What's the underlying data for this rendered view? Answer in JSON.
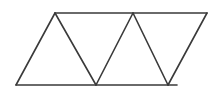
{
  "figure": {
    "background_color": "#ffffff",
    "stroke_color": "#3a3a3a",
    "stroke_width": 1.6,
    "canvas": {
      "width": 219,
      "height": 93
    }
  },
  "chart_data": {
    "type": "diagram",
    "xlabel": "",
    "ylabel": "",
    "grid": false,
    "legend": null,
    "xlim": [
      0,
      219
    ],
    "ylim": [
      0,
      93
    ],
    "vertices": {
      "top_left": [
        55,
        13
      ],
      "top_mid": [
        133,
        13
      ],
      "top_right": [
        207,
        13
      ],
      "bottom_left": [
        16,
        85
      ],
      "bottom_mid": [
        96,
        85
      ],
      "bottom_right": [
        168,
        85
      ],
      "bottom_end": [
        177,
        85
      ]
    },
    "lines": [
      {
        "name": "top-edge",
        "from": [
          55,
          13
        ],
        "to": [
          207,
          13
        ]
      },
      {
        "name": "bottom-edge",
        "from": [
          16,
          85
        ],
        "to": [
          177,
          85
        ]
      },
      {
        "name": "zigzag-1",
        "from": [
          16,
          85
        ],
        "to": [
          55,
          13
        ]
      },
      {
        "name": "zigzag-2",
        "from": [
          55,
          13
        ],
        "to": [
          96,
          85
        ]
      },
      {
        "name": "zigzag-3",
        "from": [
          96,
          85
        ],
        "to": [
          133,
          13
        ]
      },
      {
        "name": "zigzag-4",
        "from": [
          133,
          13
        ],
        "to": [
          168,
          85
        ]
      },
      {
        "name": "zigzag-5",
        "from": [
          168,
          85
        ],
        "to": [
          207,
          13
        ]
      }
    ],
    "triangles": [
      {
        "name": "triangle-1-up",
        "orientation": "up",
        "points": [
          [
            16,
            85
          ],
          [
            55,
            13
          ],
          [
            96,
            85
          ]
        ]
      },
      {
        "name": "triangle-2-down",
        "orientation": "down",
        "points": [
          [
            55,
            13
          ],
          [
            133,
            13
          ],
          [
            96,
            85
          ]
        ]
      },
      {
        "name": "triangle-3-up",
        "orientation": "up",
        "points": [
          [
            96,
            85
          ],
          [
            133,
            13
          ],
          [
            168,
            85
          ]
        ]
      },
      {
        "name": "triangle-4-down",
        "orientation": "down",
        "points": [
          [
            133,
            13
          ],
          [
            207,
            13
          ],
          [
            168,
            85
          ]
        ]
      }
    ],
    "triangle_count": 4
  }
}
